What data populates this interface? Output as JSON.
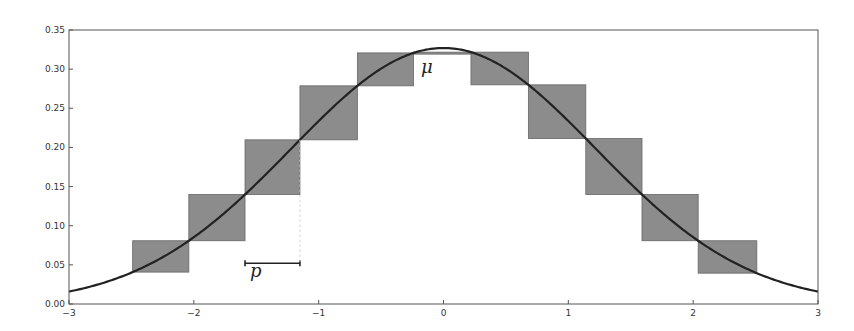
{
  "chart_data": {
    "type": "line",
    "title": "",
    "xlabel": "",
    "ylabel": "",
    "xlim": [
      -3,
      3
    ],
    "ylim": [
      0,
      0.35
    ],
    "grid": false,
    "x_ticks": [
      -3,
      -2,
      -1,
      0,
      1,
      2,
      3
    ],
    "x_tick_labels": [
      "−3",
      "−2",
      "−1",
      "0",
      "1",
      "2",
      "3"
    ],
    "y_ticks": [
      0.0,
      0.05,
      0.1,
      0.15,
      0.2,
      0.25,
      0.3,
      0.35
    ],
    "y_tick_labels": [
      "0.00",
      "0.05",
      "0.10",
      "0.15",
      "0.20",
      "0.25",
      "0.30",
      "0.35"
    ],
    "curve": {
      "name": "normal density",
      "mean": 0,
      "sigma": 1.22,
      "color": "#222222"
    },
    "boxes": {
      "description": "grey rectangles spanning consecutive grid points of step p, height from curve value at one edge to curve value at the other",
      "edges": [
        -2.49,
        -2.04,
        -1.59,
        -1.15,
        -0.69,
        -0.24,
        0.22,
        0.68,
        1.14,
        1.59,
        2.04,
        2.51
      ],
      "fill": "#8c8c8c"
    },
    "annotations": [
      {
        "text": "μ",
        "x": -0.18,
        "y": 0.295
      },
      {
        "text": "p",
        "x": -1.55,
        "y": 0.035,
        "bracket": [
          -1.59,
          -1.15
        ],
        "bracket_y": 0.052
      }
    ]
  }
}
